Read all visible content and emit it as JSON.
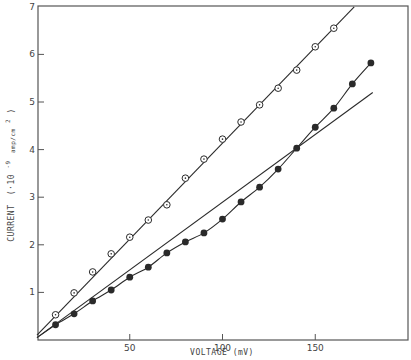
{
  "chart_data": {
    "type": "scatter",
    "title": "",
    "xlabel": "VOLTAGE (mV)",
    "ylabel": "CURRENT (·10^-9 amp/cm^2)",
    "xlim": [
      0,
      198
    ],
    "ylim": [
      0,
      7
    ],
    "x_ticks": [
      50,
      100,
      150
    ],
    "y_ticks": [
      1,
      2,
      3,
      4,
      5,
      6,
      7
    ],
    "grid": false,
    "legend": null,
    "series": [
      {
        "name": "open circles",
        "marker": "open-circle-dot",
        "x": [
          10,
          20,
          30,
          40,
          50,
          60,
          70,
          80,
          90,
          100,
          110,
          120,
          130,
          140,
          150,
          160
        ],
        "y": [
          0.53,
          0.99,
          1.43,
          1.81,
          2.16,
          2.52,
          2.84,
          3.4,
          3.8,
          4.22,
          4.58,
          4.94,
          5.29,
          5.67,
          6.16,
          6.55
        ],
        "fit": {
          "type": "linear",
          "from": [
            0,
            0.1
          ],
          "to": [
            171,
            7.0
          ]
        }
      },
      {
        "name": "filled circles",
        "marker": "filled-circle",
        "x": [
          10,
          20,
          30,
          40,
          50,
          60,
          70,
          80,
          90,
          100,
          110,
          120,
          130,
          140,
          150,
          160,
          170,
          180
        ],
        "y": [
          0.32,
          0.55,
          0.82,
          1.05,
          1.32,
          1.53,
          1.83,
          2.06,
          2.25,
          2.54,
          2.9,
          3.21,
          3.59,
          4.03,
          4.47,
          4.87,
          5.38,
          5.82
        ],
        "fit": {
          "type": "linear",
          "from": [
            0,
            0.05
          ],
          "to": [
            181,
            5.2
          ]
        },
        "curve": "smooth through points"
      }
    ]
  },
  "axes": {
    "x_tick_labels": [
      "50",
      "100",
      "150"
    ],
    "y_tick_labels": [
      "1",
      "2",
      "3",
      "4",
      "5",
      "6",
      "7"
    ],
    "x_title": "VOLTAGE (mV)",
    "y_title_main": "CURRENT",
    "y_title_units": "(·10",
    "y_title_exp": "-9",
    "y_title_sub": "amp/cm",
    "y_title_sq": "2",
    "y_title_close": ")"
  },
  "colors": {
    "ink": "#2a2a2a",
    "frame": "#555555",
    "background": "#ffffff"
  }
}
